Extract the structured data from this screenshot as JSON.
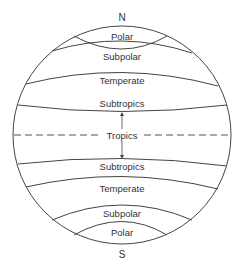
{
  "diagram": {
    "poles": {
      "north": "N",
      "south": "S"
    },
    "zones_north": [
      "Polar",
      "Subpolar",
      "Temperate",
      "Subtropics"
    ],
    "equator_label": "Tropics",
    "zones_south": [
      "Subtropics",
      "Temperate",
      "Subpolar",
      "Polar"
    ],
    "colors": {
      "line": "#444444",
      "text": "#333333",
      "background": "#ffffff"
    }
  }
}
